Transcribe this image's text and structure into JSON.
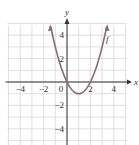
{
  "chart_data": {
    "type": "line",
    "title": "",
    "function": "f(x) = x^2 - 2x",
    "curve_label": "f",
    "xlabel": "x",
    "ylabel": "y",
    "xlim": [
      -5,
      5
    ],
    "ylim": [
      -5,
      5
    ],
    "grid": true,
    "grid_step": 1,
    "x_ticks": [
      -4,
      -2,
      0,
      2,
      4
    ],
    "x_tick_labels": [
      "−4",
      "−2",
      "0",
      "2",
      "4"
    ],
    "y_ticks": [
      4,
      2,
      -2,
      -4
    ],
    "y_tick_labels": [
      "4",
      "2",
      "−2",
      "−4"
    ],
    "series": [
      {
        "name": "f",
        "x": [
          -1.4,
          -1,
          -0.5,
          0,
          0.5,
          1,
          1.5,
          2,
          2.5,
          3,
          3.4
        ],
        "y": [
          4.76,
          3,
          1.25,
          0,
          -0.75,
          -1,
          -0.75,
          0,
          1.25,
          3,
          4.76
        ]
      }
    ],
    "key_points": {
      "x_intercepts": [
        0,
        2
      ],
      "vertex": [
        1,
        -1
      ]
    },
    "colors": {
      "curve": "#8a6a78",
      "axis": "#333333",
      "grid": "#d8d8d8"
    }
  }
}
